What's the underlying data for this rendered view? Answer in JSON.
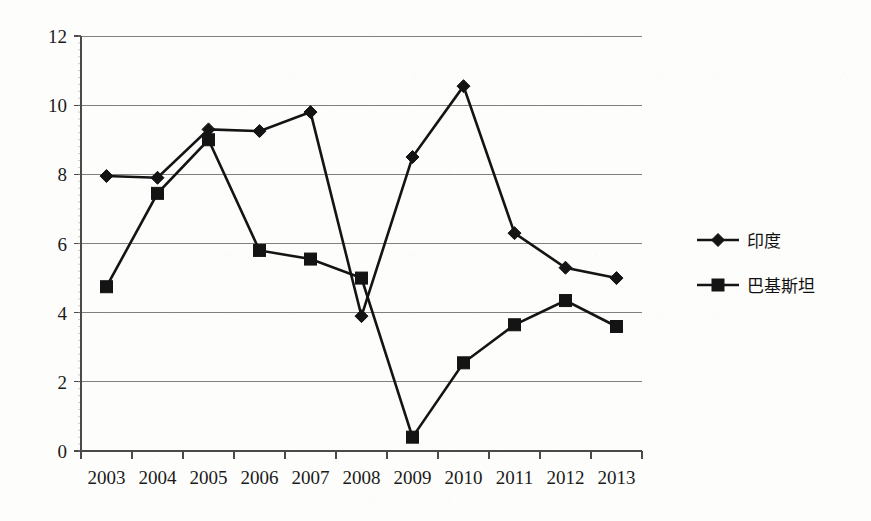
{
  "chart_data": {
    "type": "line",
    "title": "",
    "subtitle": "",
    "xlabel": "",
    "ylabel": "",
    "categories": [
      "2003",
      "2004",
      "2005",
      "2006",
      "2007",
      "2008",
      "2009",
      "2010",
      "2011",
      "2012",
      "2013"
    ],
    "ylim": [
      0,
      12
    ],
    "ytick_labels": [
      "0",
      "2",
      "4",
      "6",
      "8",
      "10",
      "12"
    ],
    "ytick_values": [
      0,
      2,
      4,
      6,
      8,
      10,
      12
    ],
    "grid": true,
    "legend_position": "right",
    "series": [
      {
        "name": "印度",
        "marker": "diamond",
        "color": "#141414",
        "values": [
          7.95,
          7.9,
          9.3,
          9.25,
          9.8,
          3.9,
          8.5,
          10.55,
          6.3,
          5.3,
          5.0
        ]
      },
      {
        "name": "巴基斯坦",
        "marker": "square",
        "color": "#141414",
        "values": [
          4.75,
          7.45,
          9.0,
          5.8,
          5.55,
          5.0,
          0.4,
          2.55,
          3.65,
          4.35,
          3.6
        ]
      }
    ]
  },
  "legend": {
    "entries": [
      {
        "label": "印度",
        "marker": "diamond"
      },
      {
        "label": "巴基斯坦",
        "marker": "square"
      }
    ]
  },
  "axes": {
    "y_labels": [
      "12",
      "10",
      "8",
      "6",
      "4",
      "2",
      "0"
    ],
    "x_labels": [
      "2003",
      "2004",
      "2005",
      "2006",
      "2007",
      "2008",
      "2009",
      "2010",
      "2011",
      "2012",
      "2013"
    ]
  },
  "colors": {
    "series": "#141414",
    "grid": "#808080",
    "axis": "#4a4a4a",
    "background": "#fdfdfc",
    "text": "#1a1a1a"
  }
}
